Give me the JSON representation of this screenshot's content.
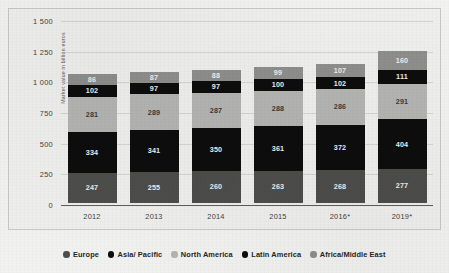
{
  "chart_data": {
    "type": "bar",
    "stacked": true,
    "title": "",
    "subtitle": "",
    "xlabel": "",
    "ylabel": "Market value in billion euros",
    "ylim": [
      0,
      1500
    ],
    "yticks": [
      "0",
      "250",
      "500",
      "750",
      "1 000",
      "1 250",
      "1 500"
    ],
    "ytick_values": [
      0,
      250,
      500,
      750,
      1000,
      1250,
      1500
    ],
    "grid": true,
    "legend_position": "bottom",
    "categories": [
      "2012",
      "2013",
      "2014",
      "2015",
      "2016*",
      "2019*"
    ],
    "series": [
      {
        "name": "Europe",
        "values": [
          247,
          255,
          260,
          263,
          268,
          277
        ]
      },
      {
        "name": "Asia/ Pacific",
        "values": [
          334,
          341,
          350,
          361,
          372,
          404
        ]
      },
      {
        "name": "North America",
        "values": [
          281,
          289,
          287,
          288,
          286,
          291
        ]
      },
      {
        "name": "Latin America",
        "values": [
          102,
          97,
          97,
          100,
          102,
          111
        ]
      },
      {
        "name": "Africa/Middle East",
        "values": [
          86,
          87,
          88,
          99,
          107,
          160
        ]
      }
    ]
  },
  "legend": {
    "items": [
      {
        "label": "Europe",
        "color": "#4d4d4b"
      },
      {
        "label": "Asia/ Pacific",
        "color": "#0d0d0d"
      },
      {
        "label": "North America",
        "color": "#b4b4b2"
      },
      {
        "label": "Latin America",
        "color": "#0d0d0d"
      },
      {
        "label": "Africa/Middle East",
        "color": "#8e8e8c"
      }
    ]
  },
  "colors": {
    "europe": "#4d4d4b",
    "asia_pacific": "#0d0d0d",
    "north_america": "#b4b4b2",
    "latin_america": "#0d0d0d",
    "africa_middle_east": "#8e8e8c",
    "plot_background": "#efefed",
    "page_background": "#f2f2f0",
    "axis": "#5d5d5b",
    "text": "#3f3f3d"
  }
}
